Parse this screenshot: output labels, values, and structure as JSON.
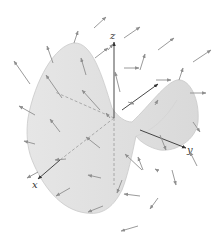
{
  "diagram": {
    "axes": {
      "x_label": "x",
      "y_label": "y",
      "z_label": "z"
    },
    "colors": {
      "surface": "#e2e2e2",
      "surface_edge": "#c4c4c4",
      "arrow": "#8f8f8f",
      "axis": "#333333",
      "hidden_axis": "#9a9a9a"
    }
  }
}
